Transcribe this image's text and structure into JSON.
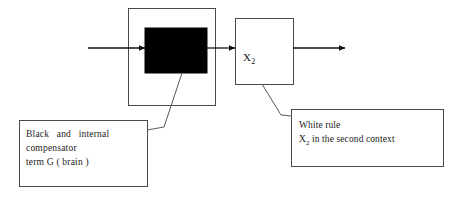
{
  "diagram": {
    "type": "block-diagram",
    "background_color": "#ffffff",
    "stroke_color": "#3a3a3a",
    "fill_black": "#000000",
    "fill_white": "#ffffff",
    "nodes": [
      {
        "id": "outer-container",
        "name": "outer-container-box",
        "label": "",
        "fill": "#ffffff",
        "x": 128,
        "y": 8,
        "width": 87,
        "height": 97
      },
      {
        "id": "black-box",
        "name": "black-box",
        "label": "",
        "fill": "#000000",
        "x": 145,
        "y": 28,
        "width": 62,
        "height": 45
      },
      {
        "id": "white-box",
        "name": "white-box",
        "label": "X2",
        "label_base": "X",
        "label_sub": "2",
        "fill": "#ffffff",
        "x": 235,
        "y": 18,
        "width": 58,
        "height": 66
      }
    ],
    "arrows": [
      {
        "id": "input-arrow",
        "name": "input-arrow",
        "from_x": 88,
        "from_y": 48,
        "to_x": 145,
        "to_y": 48
      },
      {
        "id": "middle-arrow",
        "name": "middle-arrow",
        "from_x": 207,
        "from_y": 48,
        "to_x": 235,
        "to_y": 48
      },
      {
        "id": "output-arrow",
        "name": "output-arrow",
        "from_x": 293,
        "from_y": 48,
        "to_x": 345,
        "to_y": 48
      }
    ],
    "leader_lines": [
      {
        "id": "black-leader",
        "name": "black-box-leader-line",
        "points": "182,73 164,127 147,130"
      },
      {
        "id": "white-leader",
        "name": "white-box-leader-line",
        "points": "262,84 281,115 291,116"
      }
    ],
    "captions": [
      {
        "id": "black-caption",
        "name": "black-caption-box",
        "x": 19,
        "y": 120,
        "width": 128,
        "height": 66,
        "lines": [
          "Black  and  internal",
          "compensator",
          "term G ( brain )"
        ],
        "line1": "Black and internal",
        "line2": "compensator",
        "line3": "term G ( brain )"
      },
      {
        "id": "white-caption",
        "name": "white-caption-box",
        "x": 291,
        "y": 109,
        "width": 152,
        "height": 57,
        "line1": "White rule",
        "line2_prefix": "X",
        "line2_sub": "2",
        "line2_rest": " in the second context"
      }
    ]
  }
}
